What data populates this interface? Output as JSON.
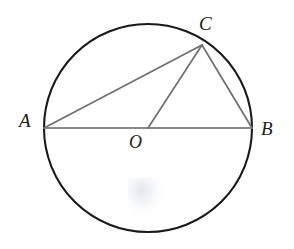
{
  "figure": {
    "background_color": "#ffffff",
    "width": 294,
    "height": 249
  },
  "labels": {
    "a": "A",
    "b": "B",
    "c": "C",
    "o": "O"
  },
  "colors": {
    "circle_stroke": "#1a1a1a",
    "chord_stroke": "#6f6f6f",
    "diameter_stroke": "#8a8a8a",
    "label_color": "#1c1c1c"
  },
  "chart_data": {
    "type": "diagram",
    "shapes": [
      {
        "name": "circle",
        "kind": "circle",
        "center": [
          148,
          128
        ],
        "radius": 104,
        "stroke": "#1a1a1a",
        "stroke_width": 2.1,
        "fill": "none"
      },
      {
        "name": "segment-AB",
        "kind": "line",
        "from": "A",
        "to": "B",
        "points": [
          [
            44,
            128
          ],
          [
            252,
            128
          ]
        ],
        "stroke": "#8a8a8a",
        "stroke_width": 1.8,
        "role": "diameter"
      },
      {
        "name": "segment-AC",
        "kind": "line",
        "from": "A",
        "to": "C",
        "points": [
          [
            44,
            128
          ],
          [
            202,
            45
          ]
        ],
        "stroke": "#6f6f6f",
        "stroke_width": 1.7,
        "role": "chord"
      },
      {
        "name": "segment-OC",
        "kind": "line",
        "from": "O",
        "to": "C",
        "points": [
          [
            148,
            128
          ],
          [
            202,
            45
          ]
        ],
        "stroke": "#6f6f6f",
        "stroke_width": 1.7,
        "role": "radius"
      },
      {
        "name": "segment-CB",
        "kind": "line",
        "from": "C",
        "to": "B",
        "points": [
          [
            202,
            45
          ],
          [
            252,
            128
          ]
        ],
        "stroke": "#6f6f6f",
        "stroke_width": 1.7,
        "role": "chord"
      }
    ],
    "points": [
      {
        "id": "A",
        "label": "A",
        "x": 44,
        "y": 128,
        "on_circle": true,
        "label_pos": [
          19,
          111
        ]
      },
      {
        "id": "B",
        "label": "B",
        "x": 252,
        "y": 128,
        "on_circle": true,
        "label_pos": [
          261,
          119
        ]
      },
      {
        "id": "C",
        "label": "C",
        "x": 202,
        "y": 45,
        "on_circle": true,
        "label_pos": [
          199,
          14
        ]
      },
      {
        "id": "O",
        "label": "O",
        "x": 148,
        "y": 128,
        "on_circle": false,
        "label_pos": [
          129,
          133
        ],
        "role": "center"
      }
    ]
  }
}
